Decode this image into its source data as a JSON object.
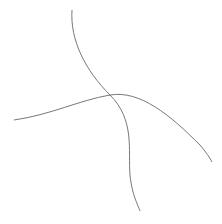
{
  "chart_data": {
    "type": "contour",
    "title": "",
    "xlabel": "",
    "ylabel": "",
    "frame": {
      "x": 12,
      "y": 8,
      "width": 201,
      "height": 204
    },
    "vortex_center": {
      "x": 150,
      "y": 112
    },
    "core_tilt_deg": -35,
    "num_contours": 18,
    "grid": false,
    "legend": null,
    "colors": {
      "frame": "#444444",
      "contour": "#222222",
      "guide": "#555555",
      "background": "#ffffff"
    }
  }
}
